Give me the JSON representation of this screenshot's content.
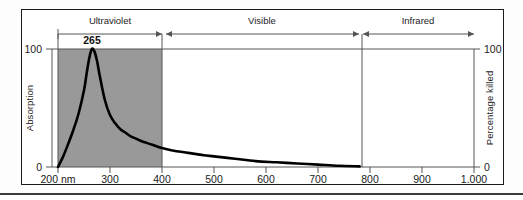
{
  "figure": {
    "name": "uv-germicidal-absorption-spectrum",
    "shaded_band_color": "#999999",
    "curve_color": "#000000",
    "axis_color": "#555555",
    "frame_color": "#1b1b1b"
  },
  "chart_data": {
    "type": "line",
    "title": "",
    "xlabel": "",
    "ylabel": "Absorption",
    "y2label": "Percentage killed",
    "xlim": [
      200,
      1000
    ],
    "ylim": [
      0,
      100
    ],
    "y2lim": [
      0,
      100
    ],
    "grid": false,
    "legend": "none",
    "x_unit": "nm",
    "x_ticks": [
      200,
      300,
      400,
      500,
      600,
      700,
      800,
      900,
      1000
    ],
    "x_tick_labels": [
      "200 nm",
      "300",
      "400",
      "500",
      "600",
      "700",
      "800",
      "900",
      "1,000"
    ],
    "y_ticks": [
      0,
      100
    ],
    "y_tick_labels": [
      "0",
      "100"
    ],
    "y2_ticks": [
      0,
      100
    ],
    "y2_tick_labels": [
      "0",
      "100"
    ],
    "series": [
      {
        "name": "Absorption / germicidal effectiveness",
        "x": [
          200,
          210,
          220,
          230,
          240,
          250,
          255,
          260,
          265,
          270,
          275,
          280,
          290,
          300,
          310,
          320,
          330,
          340,
          350,
          360,
          380,
          400,
          420,
          450,
          480,
          500,
          540,
          580,
          620,
          660,
          700,
          740,
          780
        ],
        "values": [
          0,
          9,
          20,
          32,
          46,
          65,
          79,
          92,
          100,
          98,
          90,
          78,
          57,
          44,
          37,
          32,
          29,
          26,
          24,
          22,
          19,
          16,
          14,
          12,
          10,
          9,
          7,
          5,
          4,
          3,
          2,
          1,
          0.5
        ]
      }
    ],
    "annotations": [
      {
        "name": "peak-wavelength",
        "label": "265",
        "x": 265,
        "y": 100
      }
    ],
    "shaded_regions": [
      {
        "name": "ultraviolet-band-shading",
        "x_start": 200,
        "x_end": 400,
        "color": "#999999"
      }
    ],
    "spectral_regions": [
      {
        "name": "ultraviolet",
        "label": "Ultraviolet",
        "x_start": 200,
        "x_end": 400
      },
      {
        "name": "visible",
        "label": "Visible",
        "x_start": 400,
        "x_end": 780
      },
      {
        "name": "infrared",
        "label": "Infrared",
        "x_start": 780,
        "x_end": 1000
      }
    ]
  }
}
